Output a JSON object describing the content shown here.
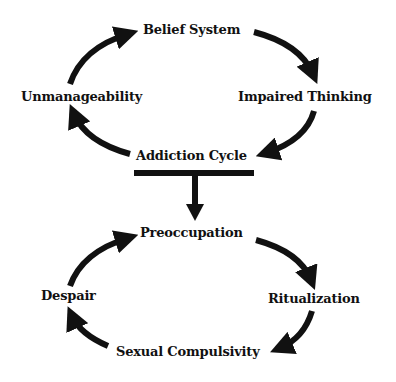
{
  "diagram": {
    "top_cycle": {
      "title": "Addiction Cycle",
      "nodes": {
        "top": "Belief System",
        "right": "Impaired Thinking",
        "bottom": "Addiction Cycle",
        "left": "Unmanageability"
      },
      "flow": [
        "Belief System",
        "Impaired Thinking",
        "Addiction Cycle",
        "Unmanageability",
        "Belief System"
      ]
    },
    "bottom_cycle": {
      "nodes": {
        "top": "Preoccupation",
        "right": "Ritualization",
        "bottom": "Sexual Compulsivity",
        "left": "Despair"
      },
      "flow": [
        "Preoccupation",
        "Ritualization",
        "Sexual Compulsivity",
        "Despair",
        "Preoccupation"
      ]
    },
    "connector": {
      "from": "Addiction Cycle",
      "to": "Preoccupation",
      "style": "T-bar with downward arrow"
    },
    "colors": {
      "ink": "#111111",
      "background": "#ffffff"
    }
  }
}
